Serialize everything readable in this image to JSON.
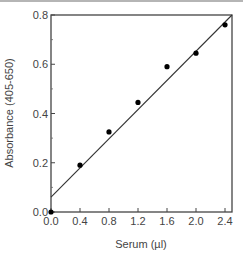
{
  "chart_data": {
    "type": "scatter",
    "title": "",
    "xlabel": "Serum (µl)",
    "ylabel": "Absorbance (405-650)",
    "xlim": [
      0.0,
      2.5
    ],
    "ylim": [
      0.0,
      0.8
    ],
    "x_ticks": [
      "0.0",
      "0.4",
      "0.8",
      "1.2",
      "1.6",
      "2.0",
      "2.4"
    ],
    "y_ticks": [
      "0.0",
      "0.2",
      "0.4",
      "0.6",
      "0.8"
    ],
    "grid": false,
    "legend": null,
    "series": [
      {
        "name": "Measured",
        "type": "scatter",
        "x": [
          0.0,
          0.4,
          0.8,
          1.2,
          1.6,
          2.0,
          2.4
        ],
        "y": [
          0.0,
          0.19,
          0.325,
          0.445,
          0.59,
          0.645,
          0.76
        ]
      },
      {
        "name": "Linear fit",
        "type": "line",
        "x": [
          0.0,
          2.5
        ],
        "y": [
          0.06,
          0.8
        ]
      }
    ]
  },
  "axes": {
    "x_title": "Serum (µl)",
    "y_title": "Absorbance (405-650)"
  }
}
